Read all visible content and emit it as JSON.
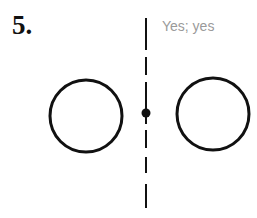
{
  "problem": {
    "number": "5."
  },
  "answer": {
    "text": "Yes; yes"
  },
  "figure": {
    "stroke_color": "#111111",
    "left_circle": {
      "cx": 86,
      "cy": 116,
      "r": 36
    },
    "right_circle": {
      "cx": 213,
      "cy": 114,
      "r": 36
    },
    "center_point": {
      "cx": 146,
      "cy": 113,
      "r": 4.5
    },
    "symmetry_line": {
      "x": 146,
      "segments": [
        [
          18,
          50
        ],
        [
          57,
          75
        ],
        [
          82,
          124
        ],
        [
          130,
          148
        ],
        [
          157,
          173
        ],
        [
          184,
          208
        ]
      ]
    }
  }
}
